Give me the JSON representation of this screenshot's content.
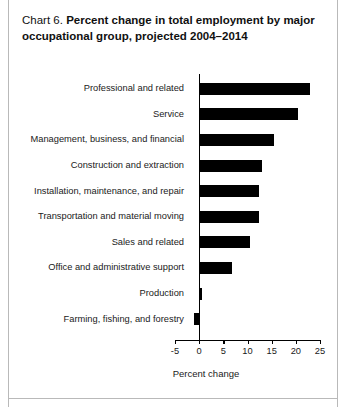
{
  "header": {
    "chart_number": "Chart 6.",
    "title": "Percent change in total employment by major occupational group, projected 2004–2014"
  },
  "axis": {
    "x_title": "Percent change",
    "tick_labels": [
      "-5",
      "0",
      "5",
      "10",
      "15",
      "20",
      "25"
    ]
  },
  "colors": {
    "bar": "#000000",
    "axis": "#000000",
    "text": "#1a1a1a",
    "background": "#ffffff"
  },
  "chart_data": {
    "type": "bar",
    "orientation": "horizontal",
    "title": "Chart 6. Percent change in total employment by major occupational group, projected 2004–2014",
    "xlabel": "Percent change",
    "ylabel": "",
    "xlim": [
      -5,
      25
    ],
    "xticks": [
      -5,
      0,
      5,
      10,
      15,
      20,
      25
    ],
    "grid": false,
    "legend": false,
    "categories": [
      "Professional and related",
      "Service",
      "Management, business, and financial",
      "Construction and extraction",
      "Installation, maintenance, and repair",
      "Transportation and material moving",
      "Sales and related",
      "Office and administrative support",
      "Production",
      "Farming, fishing, and forestry"
    ],
    "values": [
      22.9,
      20.5,
      15.4,
      12.9,
      12.3,
      12.3,
      10.6,
      6.8,
      0.5,
      -1.0
    ]
  }
}
